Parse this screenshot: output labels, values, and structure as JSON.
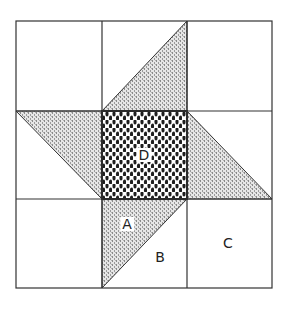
{
  "diagram": {
    "type": "quilt-block",
    "grid": {
      "rows": 3,
      "cols": 3
    },
    "labels": {
      "A": "A",
      "B": "B",
      "C": "C",
      "D": "D"
    },
    "colors": {
      "line": "#333333",
      "background": "#ffffff",
      "triangle_fill": "#b8b8b8",
      "center_fill": "#2a2a2a"
    }
  }
}
